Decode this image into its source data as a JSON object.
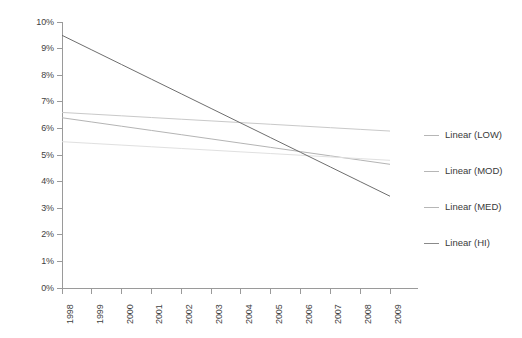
{
  "chart_data": {
    "type": "line",
    "title": "",
    "xlabel": "",
    "ylabel": "",
    "x": [
      1998,
      1999,
      2000,
      2001,
      2002,
      2003,
      2004,
      2005,
      2006,
      2007,
      2008,
      2009
    ],
    "xtick_labels": [
      "1998",
      "1999",
      "2000",
      "2001",
      "2002",
      "2003",
      "2004",
      "2005",
      "2006",
      "2007",
      "2008",
      "2009"
    ],
    "ytick_labels": [
      "10%",
      "9%",
      "8%",
      "7%",
      "6%",
      "5%",
      "4%",
      "3%",
      "2%",
      "1%",
      "0%"
    ],
    "ytick_values": [
      10,
      9,
      8,
      7,
      6,
      5,
      4,
      3,
      2,
      1,
      0
    ],
    "ylim": [
      0,
      10
    ],
    "xlim": [
      1998,
      2009
    ],
    "grid": false,
    "legend_position": "right",
    "series": [
      {
        "name": "Linear (LOW)",
        "color": "#c9c9c9",
        "trend": "linear",
        "start_value": 6.6,
        "end_value": 5.9,
        "values": [
          6.6,
          6.536,
          6.473,
          6.409,
          6.345,
          6.282,
          6.218,
          6.155,
          6.091,
          6.027,
          5.964,
          5.9
        ]
      },
      {
        "name": "Linear (MOD)",
        "color": "#b4b4b4",
        "trend": "linear",
        "start_value": 6.4,
        "end_value": 4.65,
        "values": [
          6.4,
          6.241,
          6.082,
          5.923,
          5.764,
          5.605,
          5.445,
          5.286,
          5.127,
          4.968,
          4.809,
          4.65
        ]
      },
      {
        "name": "Linear (MED)",
        "color": "#e0e0e0",
        "trend": "linear",
        "start_value": 5.5,
        "end_value": 4.8,
        "values": [
          5.5,
          5.436,
          5.373,
          5.309,
          5.245,
          5.182,
          5.118,
          5.055,
          4.991,
          4.927,
          4.864,
          4.8
        ]
      },
      {
        "name": "Linear (HI)",
        "color": "#6e6e6e",
        "trend": "linear",
        "start_value": 9.5,
        "end_value": 3.45,
        "values": [
          9.5,
          8.95,
          8.4,
          7.85,
          7.3,
          6.75,
          6.2,
          5.65,
          5.1,
          4.55,
          4.0,
          3.45
        ]
      }
    ]
  },
  "legend": {
    "items": [
      {
        "label": "Linear (LOW)",
        "color": "#b6b6b6"
      },
      {
        "label": "Linear (MOD)",
        "color": "#b6b6b6"
      },
      {
        "label": "Linear (MED)",
        "color": "#b6b6b6"
      },
      {
        "label": "Linear (HI)",
        "color": "#8a8a8a"
      }
    ]
  },
  "axes": {
    "axis_color": "#9a9a9a",
    "tick_color": "#9a9a9a",
    "label_color": "#3f3f3f"
  }
}
